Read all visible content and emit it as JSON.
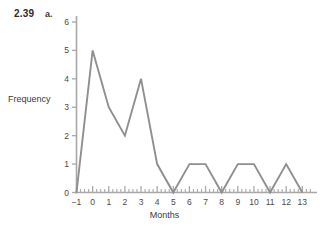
{
  "figure": {
    "exercise_number": "2.39",
    "part": "a."
  },
  "chart_data": {
    "type": "line",
    "title": "",
    "subtitle": "",
    "xlabel": "Months",
    "ylabel": "Frequency",
    "x": [
      -1,
      0,
      1,
      2,
      3,
      4,
      5,
      6,
      7,
      8,
      9,
      10,
      11,
      12,
      13
    ],
    "values": [
      0,
      5,
      3,
      2,
      4,
      1,
      0,
      1,
      1,
      0,
      1,
      1,
      0,
      1,
      0
    ],
    "series": [
      {
        "name": "Frequency",
        "values": [
          0,
          5,
          3,
          2,
          4,
          1,
          0,
          1,
          1,
          0,
          1,
          1,
          0,
          1,
          0
        ]
      }
    ],
    "xlim": [
      -1,
      13.6
    ],
    "ylim": [
      0,
      6
    ],
    "x_tick_labels": [
      "−1",
      "0",
      "1",
      "2",
      "3",
      "4",
      "5",
      "6",
      "7",
      "8",
      "9",
      "10",
      "11",
      "12",
      "13"
    ],
    "y_tick_labels": [
      "0",
      "1",
      "2",
      "3",
      "4",
      "5",
      "6"
    ],
    "x_minor_ticks_per_interval": 3,
    "grid": false,
    "legend": false,
    "legend_position": "none",
    "line_color": "#8f8f8f",
    "axis_color": "#a8a8a8",
    "marker": "none"
  }
}
